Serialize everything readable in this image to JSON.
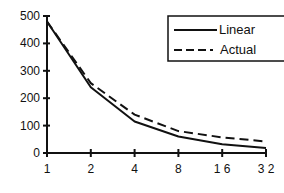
{
  "chart_data": {
    "type": "line",
    "title": "",
    "xlabel": "",
    "ylabel": "",
    "x": [
      1,
      2,
      4,
      8,
      16,
      32
    ],
    "x_tick_labels": [
      "1",
      "2",
      "4",
      "8",
      "16",
      "32"
    ],
    "x_scale": "log2",
    "y_ticks": [
      0,
      100,
      200,
      300,
      400,
      500
    ],
    "y_tick_labels": [
      "0",
      "100",
      "200",
      "300",
      "400",
      "500"
    ],
    "ylim": [
      0,
      500
    ],
    "grid": false,
    "legend_position": "upper right",
    "series": [
      {
        "name": "Linear",
        "style": "solid",
        "values": [
          480,
          240,
          115,
          60,
          32,
          18
        ]
      },
      {
        "name": "Actual",
        "style": "dashed",
        "values": [
          480,
          255,
          140,
          80,
          57,
          42
        ]
      }
    ]
  },
  "legend": {
    "items": [
      {
        "label": "Linear",
        "style": "solid"
      },
      {
        "label": "Actual",
        "style": "dashed"
      }
    ]
  },
  "colors": {
    "line": "#111111",
    "background": "#ffffff"
  }
}
